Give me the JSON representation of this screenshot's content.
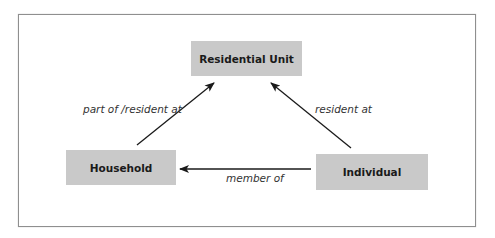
{
  "diagram": {
    "nodes": [
      {
        "id": "residential-unit",
        "label": "Residential Unit"
      },
      {
        "id": "household",
        "label": "Household"
      },
      {
        "id": "individual",
        "label": "Individual"
      }
    ],
    "edges": [
      {
        "from": "household",
        "to": "residential-unit",
        "label": "part of /resident at"
      },
      {
        "from": "individual",
        "to": "residential-unit",
        "label": "resident at"
      },
      {
        "from": "individual",
        "to": "household",
        "label": "member of"
      }
    ],
    "colors": {
      "node_fill": "#c9c9c9",
      "edge": "#1a1a1a",
      "frame": "#8f8f8f"
    }
  }
}
